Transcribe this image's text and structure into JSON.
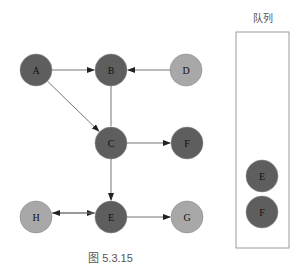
{
  "colors": {
    "dark": "#5e5e5e",
    "light": "#a8a8a8",
    "edge": "#777777",
    "arrow": "#222222"
  },
  "graph": {
    "nodes": [
      {
        "id": "A",
        "label": "A",
        "x": 36,
        "y": 70,
        "shade": "dark"
      },
      {
        "id": "B",
        "label": "B",
        "x": 111,
        "y": 70,
        "shade": "dark"
      },
      {
        "id": "D",
        "label": "D",
        "x": 186,
        "y": 70,
        "shade": "light"
      },
      {
        "id": "C",
        "label": "C",
        "x": 111,
        "y": 143,
        "shade": "dark"
      },
      {
        "id": "F",
        "label": "F",
        "x": 187,
        "y": 143,
        "shade": "dark"
      },
      {
        "id": "H",
        "label": "H",
        "x": 36,
        "y": 217,
        "shade": "light"
      },
      {
        "id": "E",
        "label": "E",
        "x": 111,
        "y": 217,
        "shade": "dark"
      },
      {
        "id": "G",
        "label": "G",
        "x": 187,
        "y": 217,
        "shade": "light"
      }
    ],
    "edges": [
      {
        "from": "A",
        "to": "B",
        "directed": true
      },
      {
        "from": "D",
        "to": "B",
        "directed": true
      },
      {
        "from": "A",
        "to": "C",
        "directed": true
      },
      {
        "from": "B",
        "to": "C",
        "directed": false
      },
      {
        "from": "C",
        "to": "F",
        "directed": true
      },
      {
        "from": "C",
        "to": "E",
        "directed": true
      },
      {
        "from": "H",
        "to": "E",
        "directed": true,
        "offset": -4
      },
      {
        "from": "E",
        "to": "H",
        "directed": true,
        "offset": 4
      },
      {
        "from": "E",
        "to": "G",
        "directed": true
      }
    ]
  },
  "queue": {
    "title": "队列",
    "items": [
      {
        "label": "E",
        "x": 262,
        "y": 176
      },
      {
        "label": "F",
        "x": 262,
        "y": 212
      }
    ]
  },
  "caption": "图 5.3.15"
}
